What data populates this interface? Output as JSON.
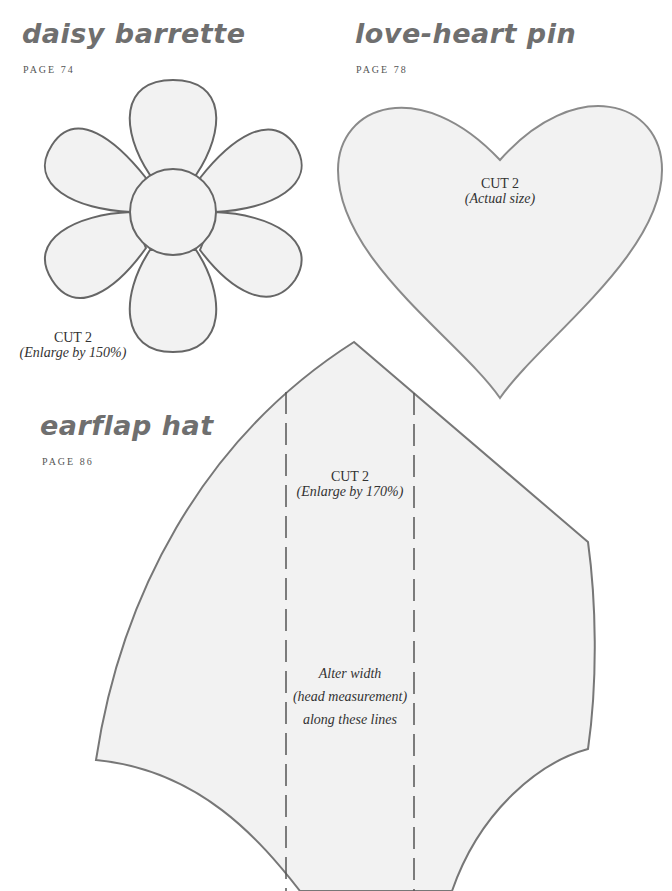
{
  "patterns": [
    {
      "title": "daisy barrette",
      "page_ref": "PAGE 74",
      "cut_label": "CUT 2",
      "cut_note": "(Enlarge by 150%)"
    },
    {
      "title": "love-heart pin",
      "page_ref": "PAGE 78",
      "cut_label": "CUT 2",
      "cut_note": "(Actual size)"
    },
    {
      "title": "earflap hat",
      "page_ref": "PAGE 86",
      "cut_label": "CUT 2",
      "cut_note": "(Enlarge by 170%)",
      "alter_lines": [
        "Alter width",
        "(head measurement)",
        "along these lines"
      ]
    }
  ],
  "colors": {
    "shape_fill": "#f2f2f2",
    "shape_outline": "#6a6a6a",
    "title_text": "#6f6f6f"
  }
}
